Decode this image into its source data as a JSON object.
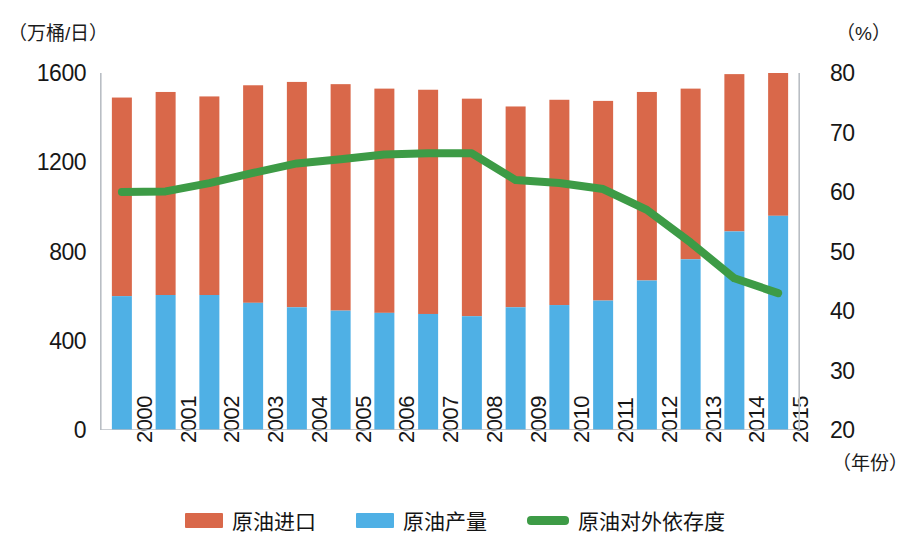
{
  "chart_data": {
    "type": "bar",
    "title": "",
    "subtitle": "",
    "xlabel": "（年份）",
    "ylabel": "（万桶/日）",
    "y2label": "（%）",
    "grid": false,
    "legend_position": "bottom",
    "categories": [
      "2000",
      "2001",
      "2002",
      "2003",
      "2004",
      "2005",
      "2006",
      "2007",
      "2008",
      "2009",
      "2010",
      "2011",
      "2012",
      "2013",
      "2014",
      "2015"
    ],
    "yticks": [
      0,
      400,
      800,
      1200,
      1600
    ],
    "ylim": [
      0,
      1600
    ],
    "y2ticks": [
      20,
      30,
      40,
      50,
      60,
      70,
      80
    ],
    "y2lim": [
      20,
      80
    ],
    "stacked": true,
    "series": [
      {
        "name": "原油产量",
        "type": "bar",
        "color": "#4FB0E5",
        "axis": "left",
        "values": [
          600,
          605,
          605,
          570,
          550,
          535,
          525,
          520,
          510,
          550,
          560,
          580,
          670,
          765,
          890,
          960
        ]
      },
      {
        "name": "原油进口",
        "type": "bar",
        "color": "#D9684A",
        "axis": "left",
        "values": [
          890,
          910,
          890,
          975,
          1010,
          1015,
          1005,
          1005,
          975,
          900,
          920,
          895,
          845,
          765,
          705,
          660
        ]
      },
      {
        "name": "原油对外依存度",
        "type": "line",
        "color": "#3D9B46",
        "axis": "right",
        "values": [
          60.0,
          60.1,
          61.5,
          63.2,
          64.8,
          65.5,
          66.3,
          66.5,
          66.5,
          62.0,
          61.5,
          60.5,
          57.0,
          51.5,
          45.5,
          43.0
        ]
      }
    ]
  },
  "legend": {
    "items": [
      {
        "label": "原油进口",
        "shape": "bar",
        "color": "#D9684A"
      },
      {
        "label": "原油产量",
        "shape": "bar",
        "color": "#4FB0E5"
      },
      {
        "label": "原油对外依存度",
        "shape": "line",
        "color": "#3D9B46"
      }
    ]
  },
  "colors": {
    "import": "#D9684A",
    "production": "#4FB0E5",
    "dependency": "#3D9B46",
    "axis": "#b9bec4",
    "text": "#171717"
  }
}
